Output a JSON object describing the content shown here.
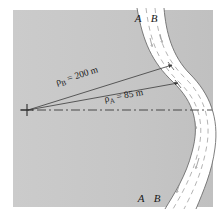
{
  "figure": {
    "name": "curved-road-radius-of-curvature-diagram",
    "background_color": "#c9c9c9",
    "road_color": "#ffffff",
    "line_color": "#3a3a3a",
    "lane_line_color": "#9a9a9a",
    "labels": {
      "lane_a_top": "A",
      "lane_b_top": "B",
      "lane_a_bottom": "A",
      "lane_b_bottom": "B"
    },
    "dimensions": [
      {
        "id": "rho-b",
        "symbol": "ρ",
        "subscript": "B",
        "equals": "=",
        "value": "200",
        "unit": "m",
        "text": "ρB = 200 m"
      },
      {
        "id": "rho-a",
        "symbol": "ρ",
        "subscript": "A",
        "equals": "=",
        "value": "85",
        "unit": "m",
        "text": "ρA = 85 m"
      }
    ],
    "markers": {
      "center_of_curvature": "cross-marker",
      "axis": "dash-dot-centerline"
    }
  }
}
